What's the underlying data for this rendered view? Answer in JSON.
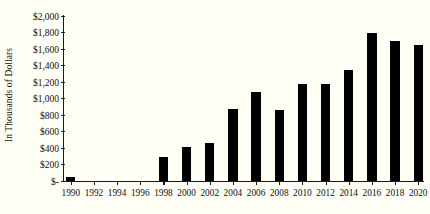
{
  "chart_data": {
    "type": "bar",
    "title": "",
    "xlabel": "",
    "ylabel": "In Thousands of Dollars",
    "ylim": [
      0,
      2000
    ],
    "grid": false,
    "legend": null,
    "y_tick_labels": [
      "$2,000",
      "$1,800",
      "$1,600",
      "$1,400",
      "$1,200",
      "$1,000",
      "$800",
      "$600",
      "$400",
      "$200",
      "$-"
    ],
    "y_tick_values": [
      2000,
      1800,
      1600,
      1400,
      1200,
      1000,
      800,
      600,
      400,
      200,
      0
    ],
    "categories": [
      "1990",
      "1991",
      "1992",
      "1993",
      "1994",
      "1995",
      "1996",
      "1997",
      "1998",
      "1999",
      "2000",
      "2001",
      "2002",
      "2003",
      "2004",
      "2005",
      "2006",
      "2007",
      "2008",
      "2009",
      "2010",
      "2011",
      "2012",
      "2013",
      "2014",
      "2015",
      "2016",
      "2017",
      "2018",
      "2019",
      "2020"
    ],
    "x_tick_labels": [
      "1990",
      "1992",
      "1994",
      "1996",
      "1998",
      "2000",
      "2002",
      "2004",
      "2006",
      "2008",
      "2010",
      "2012",
      "2014",
      "2016",
      "2018",
      "2020"
    ],
    "values": [
      45,
      null,
      null,
      null,
      null,
      null,
      null,
      null,
      290,
      null,
      410,
      null,
      455,
      null,
      870,
      null,
      1080,
      null,
      855,
      null,
      1175,
      null,
      1175,
      null,
      1350,
      null,
      1790,
      null,
      1700,
      null,
      1645
    ],
    "bar_color": "#000000",
    "background_color": "#fffef5",
    "axis_color": "#1a1a1a"
  }
}
